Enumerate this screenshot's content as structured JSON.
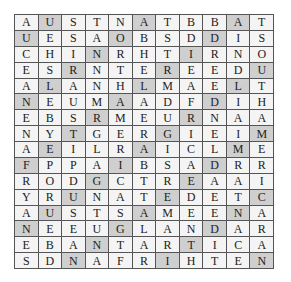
{
  "puzzle": {
    "type": "word-search",
    "rows": 16,
    "cols": 11,
    "colors": {
      "cell": "#f4f4f4",
      "shaded_cell": "#cfcfcf",
      "border": "#555555",
      "text": "#222222"
    },
    "grid": [
      [
        "A",
        "U",
        "S",
        "T",
        "N",
        "A",
        "T",
        "B",
        "B",
        "A",
        "T"
      ],
      [
        "U",
        "E",
        "S",
        "A",
        "O",
        "B",
        "S",
        "D",
        "D",
        "I",
        "S"
      ],
      [
        "C",
        "H",
        "I",
        "N",
        "R",
        "H",
        "T",
        "I",
        "R",
        "N",
        "O"
      ],
      [
        "E",
        "S",
        "R",
        "N",
        "T",
        "E",
        "R",
        "E",
        "E",
        "D",
        "U"
      ],
      [
        "A",
        "L",
        "A",
        "N",
        "H",
        "L",
        "M",
        "A",
        "E",
        "L",
        "T"
      ],
      [
        "N",
        "E",
        "U",
        "M",
        "A",
        "A",
        "D",
        "F",
        "D",
        "I",
        "H"
      ],
      [
        "E",
        "B",
        "S",
        "R",
        "M",
        "E",
        "U",
        "R",
        "N",
        "A",
        "A"
      ],
      [
        "N",
        "Y",
        "T",
        "G",
        "E",
        "R",
        "G",
        "I",
        "E",
        "I",
        "M"
      ],
      [
        "A",
        "E",
        "I",
        "L",
        "R",
        "A",
        "I",
        "C",
        "L",
        "M",
        "E"
      ],
      [
        "F",
        "P",
        "P",
        "A",
        "I",
        "B",
        "S",
        "A",
        "D",
        "R",
        "R"
      ],
      [
        "R",
        "O",
        "D",
        "G",
        "C",
        "T",
        "R",
        "E",
        "A",
        "A",
        "I"
      ],
      [
        "Y",
        "R",
        "U",
        "N",
        "A",
        "T",
        "E",
        "D",
        "E",
        "T",
        "C"
      ],
      [
        "A",
        "U",
        "S",
        "T",
        "S",
        "A",
        "M",
        "E",
        "E",
        "N",
        "A"
      ],
      [
        "N",
        "E",
        "E",
        "U",
        "G",
        "L",
        "A",
        "N",
        "D",
        "A",
        "R"
      ],
      [
        "E",
        "B",
        "A",
        "N",
        "T",
        "A",
        "R",
        "T",
        "I",
        "C",
        "A"
      ],
      [
        "S",
        "D",
        "N",
        "A",
        "F",
        "R",
        "I",
        "H",
        "T",
        "E",
        "N"
      ]
    ],
    "shaded": [
      [
        1,
        5,
        9
      ],
      [
        0,
        4,
        8
      ],
      [
        3,
        7
      ],
      [
        2,
        6,
        10
      ],
      [
        1,
        5,
        9
      ],
      [
        0,
        4,
        8
      ],
      [
        3,
        7
      ],
      [
        2,
        6,
        10
      ],
      [
        1,
        5,
        9
      ],
      [
        0,
        4,
        8
      ],
      [
        3,
        7
      ],
      [
        2,
        6,
        10
      ],
      [
        1,
        5,
        9
      ],
      [
        0,
        4,
        8
      ],
      [
        3,
        7
      ],
      [
        2,
        6,
        10
      ]
    ]
  }
}
